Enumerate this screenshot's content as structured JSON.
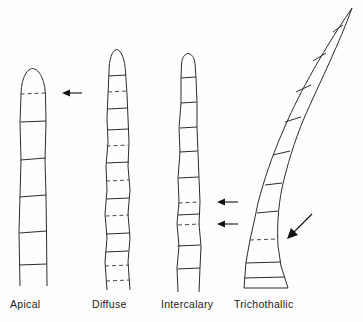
{
  "figure": {
    "background_color": "#fefefe",
    "line_color": "#2b2b2b",
    "dash_color": "#4a4a4a",
    "arrow_color": "#111111"
  },
  "legend_meaning": {
    "solid_crosswall": "existing cross wall",
    "dashed_crosswall": "newly forming cross wall (site of cell division)",
    "arrow": "points to growth / division zone"
  },
  "panels": [
    {
      "id": "apical",
      "label": "Apical",
      "label_x": 10,
      "label_y": 298,
      "tip": "rounded",
      "curved": false,
      "arrow_count": 1,
      "arrow_direction": "left",
      "dashed_walls": 1,
      "solid_walls": 5,
      "growth_zone": "at the tip"
    },
    {
      "id": "diffuse",
      "label": "Diffuse",
      "label_x": 92,
      "label_y": 298,
      "tip": "rounded",
      "curved": false,
      "arrow_count": 0,
      "arrow_direction": "none",
      "dashed_walls": 6,
      "solid_walls": 7,
      "growth_zone": "throughout the filament"
    },
    {
      "id": "intercalary",
      "label": "Intercalary",
      "label_x": 161,
      "label_y": 298,
      "tip": "rounded",
      "curved": false,
      "arrow_count": 2,
      "arrow_direction": "left",
      "dashed_walls": 2,
      "solid_walls": 7,
      "growth_zone": "in the middle region"
    },
    {
      "id": "trichothallic",
      "label": "Trichothallic",
      "label_x": 234,
      "label_y": 298,
      "tip": "tapered",
      "curved": true,
      "arrow_count": 1,
      "arrow_direction": "down-left-diagonal",
      "dashed_walls": 1,
      "solid_walls": 9,
      "growth_zone": "near the base"
    }
  ]
}
